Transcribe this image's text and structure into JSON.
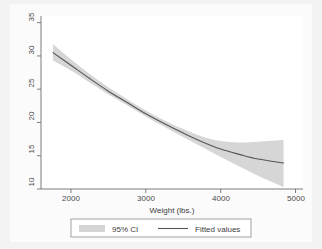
{
  "chart_data": {
    "type": "line",
    "title": "",
    "subtitle": "",
    "xlabel": "Weight (lbs.)",
    "ylabel": "",
    "xlim": [
      1600,
      5100
    ],
    "ylim": [
      10,
      36
    ],
    "xticks": [
      2000,
      3000,
      4000,
      5000
    ],
    "xticklabels": [
      "2000",
      "3000",
      "4000",
      "5000"
    ],
    "yticks": [
      10,
      15,
      20,
      25,
      30,
      35
    ],
    "yticklabels": [
      "10",
      "15",
      "20",
      "25",
      "30",
      "35"
    ],
    "grid": false,
    "legend_position": "bottom",
    "legend": [
      {
        "key": "ci",
        "label": "95% CI",
        "marker": "band",
        "color": "#d3d3d3"
      },
      {
        "key": "fit",
        "label": "Fitted values",
        "marker": "line",
        "color": "#555555"
      }
    ],
    "series": [
      {
        "name": "Fitted values",
        "type": "line",
        "color": "#555555",
        "x": [
          1760,
          2000,
          2250,
          2500,
          2750,
          3000,
          3250,
          3500,
          3750,
          4000,
          4250,
          4500,
          4840
        ],
        "y": [
          30.5,
          28.6,
          26.6,
          24.7,
          23.0,
          21.3,
          19.8,
          18.4,
          17.1,
          16.0,
          15.2,
          14.5,
          13.9
        ]
      },
      {
        "name": "95% CI lower",
        "type": "band-lower",
        "color": "#d3d3d3",
        "x": [
          1760,
          2000,
          2250,
          2500,
          2750,
          3000,
          3250,
          3500,
          3750,
          4000,
          4250,
          4500,
          4840
        ],
        "y": [
          29.3,
          27.8,
          26.0,
          24.2,
          22.6,
          20.9,
          19.3,
          17.8,
          16.3,
          14.8,
          13.4,
          12.0,
          10.3
        ]
      },
      {
        "name": "95% CI upper",
        "type": "band-upper",
        "color": "#d3d3d3",
        "x": [
          1760,
          2000,
          2250,
          2500,
          2750,
          3000,
          3250,
          3500,
          3750,
          4000,
          4250,
          4500,
          4840
        ],
        "y": [
          31.8,
          29.5,
          27.3,
          25.3,
          23.5,
          21.8,
          20.3,
          19.0,
          17.9,
          17.2,
          17.0,
          17.1,
          17.4
        ]
      }
    ]
  },
  "axes": {
    "x_title": "Weight (lbs.)",
    "x_tick_0": "2000",
    "x_tick_1": "3000",
    "x_tick_2": "4000",
    "x_tick_3": "5000",
    "y_tick_0": "10",
    "y_tick_1": "15",
    "y_tick_2": "20",
    "y_tick_3": "25",
    "y_tick_4": "30",
    "y_tick_5": "35"
  },
  "legend": {
    "ci_label": "95% CI",
    "fit_label": "Fitted values"
  },
  "colors": {
    "band": "#d4d4d4",
    "line": "#555555",
    "axis": "#6e6e6e",
    "text": "#3d3d3d",
    "page_background": "#f3f3f3",
    "plot_background": "#ffffff"
  }
}
